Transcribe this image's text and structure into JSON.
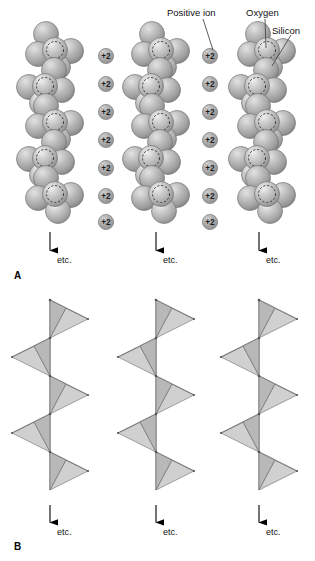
{
  "figure": {
    "title_visible": false,
    "background_color": "#ffffff"
  },
  "labels": {
    "positive_ion": "Positive ion",
    "oxygen": "Oxygen",
    "silicon": "Silicon"
  },
  "panels": [
    {
      "letter": "A",
      "x": 14,
      "y": 271
    },
    {
      "letter": "B",
      "x": 14,
      "y": 542
    }
  ],
  "etc_label": "etc.",
  "etc_arrows_a": [
    {
      "x": 50,
      "y_top": 232,
      "y_bottom": 259,
      "label_x": 57,
      "label_y": 256
    },
    {
      "x": 156,
      "y_top": 232,
      "y_bottom": 259,
      "label_x": 163,
      "label_y": 256
    },
    {
      "x": 259,
      "y_top": 232,
      "y_bottom": 259,
      "label_x": 266,
      "label_y": 256
    }
  ],
  "etc_arrows_b": [
    {
      "x": 50,
      "y_top": 505,
      "y_bottom": 531,
      "label_x": 57,
      "label_y": 528
    },
    {
      "x": 156,
      "y_top": 505,
      "y_bottom": 531,
      "label_x": 163,
      "label_y": 528
    },
    {
      "x": 259,
      "y_top": 505,
      "y_bottom": 531,
      "label_x": 266,
      "label_y": 528
    }
  ],
  "colors": {
    "oxygen_sphere_fill": "#b9b9b9",
    "oxygen_sphere_highlight": "#e8e8e8",
    "oxygen_sphere_shadow": "#8d8d8d",
    "oxygen_sphere_stroke": "#6e6e6e",
    "silicon_circle_stroke": "#3a3a3a",
    "ion_fill": "#a8a8a8",
    "ion_stroke": "#7a7a7a",
    "ion_text": "#1b1b1b",
    "tetra_face_light": "#f4f4f4",
    "tetra_face_mid": "#d0d0d0",
    "tetra_face_dark": "#b4b4b4",
    "tetra_stroke": "#7d7d7d",
    "leader_line": "#4a4a4a",
    "arrow": "#000000",
    "text": "#111111"
  },
  "ion_charge_text": "+2",
  "ion_columns": [
    {
      "name": "left-ion-column",
      "x": 106,
      "ions": [
        {
          "y": 56
        },
        {
          "y": 84
        },
        {
          "y": 112
        },
        {
          "y": 140
        },
        {
          "y": 168
        },
        {
          "y": 196
        },
        {
          "y": 222
        }
      ]
    },
    {
      "name": "right-ion-column",
      "x": 210,
      "ions": [
        {
          "y": 56
        },
        {
          "y": 84
        },
        {
          "y": 112
        },
        {
          "y": 140
        },
        {
          "y": 168
        },
        {
          "y": 196
        },
        {
          "y": 222
        }
      ]
    }
  ],
  "chains_a": [
    {
      "name": "chain-a-left",
      "cx": 50
    },
    {
      "name": "chain-a-middle",
      "cx": 156
    },
    {
      "name": "chain-a-right",
      "cx": 262
    }
  ],
  "chains_b": [
    {
      "name": "chain-b-left",
      "cx": 50
    },
    {
      "name": "chain-b-middle",
      "cx": 156
    },
    {
      "name": "chain-b-right",
      "cx": 259
    }
  ],
  "chain_a_geometry": {
    "y_start": 40,
    "unit_spacing": 36,
    "units": 5,
    "oxygen_radius": 12.5,
    "silicon_radius": 8.5,
    "lateral_offset": 17
  },
  "chain_b_geometry": {
    "y_start": 300,
    "unit_spacing": 38,
    "units": 5,
    "half_width": 38,
    "depth": 11
  },
  "leaders": [
    {
      "name": "positive-ion-leader",
      "from_x": 203,
      "from_y": 19,
      "to_x": 213,
      "to_y": 50
    },
    {
      "name": "oxygen-leader",
      "from_x": 265,
      "from_y": 19,
      "to_x": 266,
      "to_y": 48
    },
    {
      "name": "silicon-leader",
      "from_x": 291,
      "from_y": 35,
      "to_x": 272,
      "to_y": 66
    }
  ],
  "label_positions": {
    "positive_ion": {
      "x": 167,
      "y": 8
    },
    "oxygen": {
      "x": 246,
      "y": 8
    },
    "silicon": {
      "x": 272,
      "y": 26
    }
  }
}
